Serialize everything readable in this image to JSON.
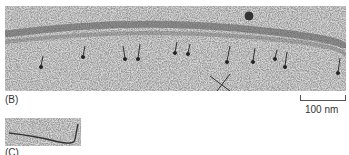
{
  "figure": {
    "panels": [
      {
        "id": "B",
        "label": "(B)",
        "description": "electron micrograph of filament with attached heads"
      },
      {
        "id": "C",
        "label": "(C)",
        "description": "electron micrograph of single filament"
      }
    ],
    "scale_bar": {
      "label": "100 nm"
    }
  },
  "colors": {
    "background": "#ffffff",
    "micrograph_base": "#c8c8c8",
    "grain": "#555555",
    "text": "#333333"
  }
}
